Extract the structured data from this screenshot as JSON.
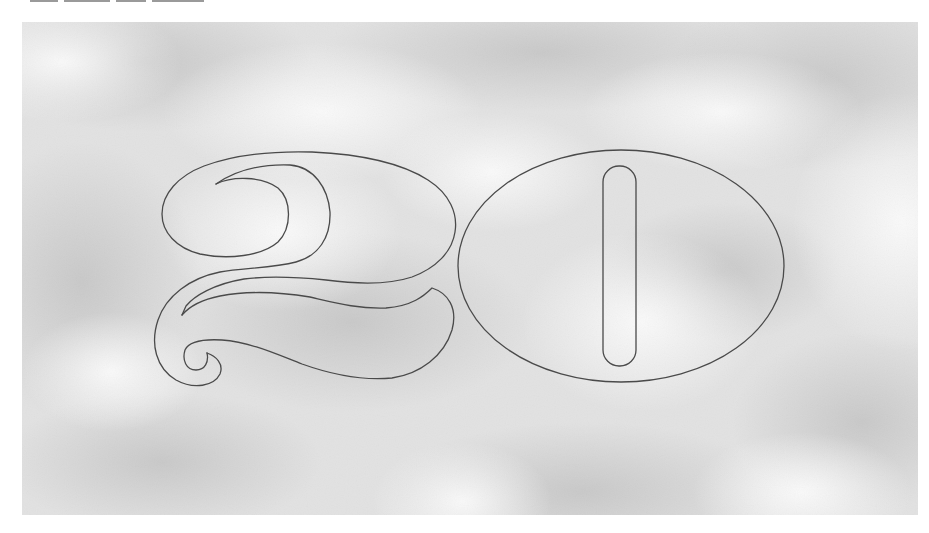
{
  "figure": {
    "numeral_text": "20",
    "colors": {
      "page_background": "#ffffff",
      "panel_base": "#e4e4e4",
      "cloud_light": "#f7f7f7",
      "cloud_dark": "#c9c9c9",
      "outline_stroke": "#4a4a4a"
    },
    "panel_bounds": {
      "x": 22,
      "y": 22,
      "width": 896,
      "height": 493
    },
    "digits": [
      {
        "char": "2",
        "style": "outlined decorative with swash tail"
      },
      {
        "char": "0",
        "style": "outlined ellipse with rounded vertical slot counter"
      }
    ]
  }
}
